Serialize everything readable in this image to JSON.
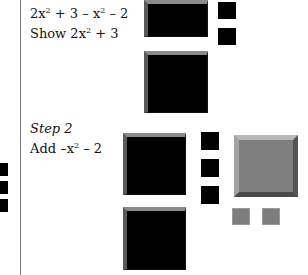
{
  "step1": {
    "expression_parts": [
      "2x",
      "2",
      " + 3 – x",
      "2",
      " – 2"
    ],
    "instruction_parts": [
      "Show 2x",
      "2",
      " + 3"
    ]
  },
  "step2": {
    "title": "Step 2",
    "instruction_parts": [
      "Add –x",
      "2",
      " – 2"
    ]
  },
  "colors": {
    "positive_tile": "#000000",
    "negative_tile": "#7f7f7f",
    "divider": "#777777"
  },
  "tiles": {
    "step1": {
      "x_squared_positive": 2,
      "unit_positive": 2
    },
    "step2": {
      "x_squared_positive": 2,
      "unit_positive": 3,
      "x_squared_negative": 1,
      "unit_negative": 2
    }
  }
}
